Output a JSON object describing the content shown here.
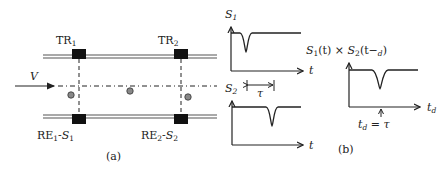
{
  "panel_a": {
    "caption": "(a)",
    "velocity_label": "V",
    "transmitters": [
      {
        "base": "TR",
        "sub": "1"
      },
      {
        "base": "TR",
        "sub": "2"
      }
    ],
    "receivers": [
      {
        "base": "RE",
        "sub": "1",
        "signal": "S",
        "signal_sub": "1"
      },
      {
        "base": "RE",
        "sub": "2",
        "signal": "S",
        "signal_sub": "2"
      }
    ],
    "particle_count": 3
  },
  "panel_b": {
    "caption": "(b)",
    "plot_s1": {
      "ylabel": "S",
      "ylabel_sub": "1",
      "xlabel": "t"
    },
    "plot_s2": {
      "ylabel": "S",
      "ylabel_sub": "2",
      "xlabel": "t"
    },
    "delay_label": "τ",
    "correlation_title": "S₁(t) × S₂(t−d)",
    "correlation_title_parts": {
      "s1": "S",
      "s1_sub": "1",
      "mid": "(t) × ",
      "s2": "S",
      "s2_sub": "2",
      "arg": "(t−",
      "arg_sub": "d",
      "close": ")"
    },
    "correlation_xlabel": "t",
    "correlation_xlabel_sub": "d",
    "peak_annotation": {
      "lhs": "t",
      "lhs_sub": "d",
      "eq": " = ",
      "rhs": "τ"
    }
  },
  "colors": {
    "line": "#222222",
    "rail": "#555555",
    "particle": "#888888"
  }
}
